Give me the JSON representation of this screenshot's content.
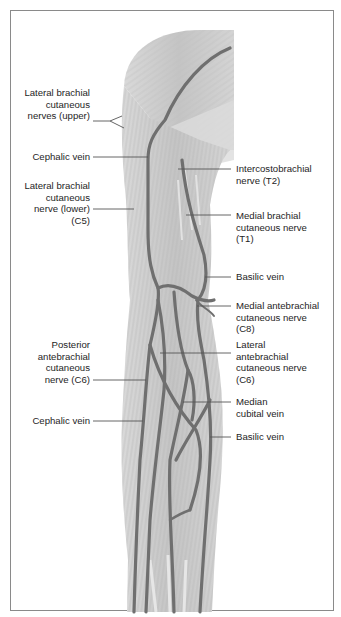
{
  "figure": {
    "colors": {
      "frame": "#8a8a8a",
      "skin_fill": "#cfcfcf",
      "muscle_shade": "#b9b9b9",
      "vein": "#6f6f6f",
      "leader_line": "#555555",
      "text": "#1e1e1e"
    }
  },
  "labels_left": [
    {
      "id": "lat-brachial-upper",
      "lines": [
        "Lateral brachial",
        "cutaneous",
        "nerves (upper)"
      ]
    },
    {
      "id": "cephalic-vein-upper",
      "lines": [
        "Cephalic vein"
      ]
    },
    {
      "id": "lat-brachial-lower",
      "lines": [
        "Lateral brachial",
        "cutaneous",
        "nerve (lower)",
        "(C5)"
      ]
    },
    {
      "id": "posterior-antebrachial",
      "lines": [
        "Posterior",
        "antebrachial",
        "cutaneous",
        "nerve (C6)"
      ]
    },
    {
      "id": "cephalic-vein-lower",
      "lines": [
        "Cephalic vein"
      ]
    }
  ],
  "labels_right": [
    {
      "id": "intercostobrachial",
      "lines": [
        "Intercostobrachial",
        "nerve (T2)"
      ]
    },
    {
      "id": "medial-brachial",
      "lines": [
        "Medial brachial",
        "cutaneous nerve",
        "(T1)"
      ]
    },
    {
      "id": "basilic-vein-upper",
      "lines": [
        "Basilic vein"
      ]
    },
    {
      "id": "medial-antebrachial",
      "lines": [
        "Medial antebrachial",
        "cutaneous nerve",
        "(C8)"
      ]
    },
    {
      "id": "lateral-antebrachial",
      "lines": [
        "Lateral",
        "antebrachial",
        "cutaneous nerve",
        "(C6)"
      ]
    },
    {
      "id": "median-cubital",
      "lines": [
        "Median",
        "cubital vein"
      ]
    },
    {
      "id": "basilic-vein-lower",
      "lines": [
        "Basilic vein"
      ]
    }
  ]
}
